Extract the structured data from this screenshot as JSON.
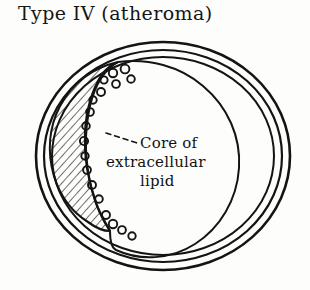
{
  "figure": {
    "title": "Type IV (atheroma)",
    "kind": "hand-drawn medical cross-section diagram"
  },
  "annotation": {
    "line1": "Core of",
    "line2": "extracellular",
    "line3": "lipid",
    "leader": "dashed-leader-line"
  },
  "colors": {
    "ink": "#141414",
    "background": "#fdfdfc",
    "hatch": "#1a1a1a"
  },
  "structure": {
    "wall_rings": [
      {
        "name": "adventitia-outer-ring",
        "rx": 127,
        "ry": 114
      },
      {
        "name": "media-middle-ring",
        "rx": 119,
        "ry": 106
      },
      {
        "name": "intima-inner-ring",
        "rx": 111,
        "ry": 99
      }
    ],
    "lumen": {
      "name": "lumen-boundary",
      "rx": 93,
      "ry": 86
    },
    "lesion": {
      "name": "atheroma-plaque",
      "fill": "diagonal-hatching",
      "position": "left-crescent"
    },
    "foam_cells_upper": [
      {
        "cx": 113,
        "cy": 73,
        "r": 4.2
      },
      {
        "cx": 125,
        "cy": 69,
        "r": 4.4
      },
      {
        "cx": 131,
        "cy": 79,
        "r": 3.8
      },
      {
        "cx": 116,
        "cy": 84,
        "r": 3.9
      },
      {
        "cx": 104,
        "cy": 80,
        "r": 3.6
      },
      {
        "cx": 101,
        "cy": 92,
        "r": 4.0
      },
      {
        "cx": 93,
        "cy": 100,
        "r": 3.7
      },
      {
        "cx": 90,
        "cy": 112,
        "r": 3.9
      },
      {
        "cx": 86,
        "cy": 126,
        "r": 3.8
      },
      {
        "cx": 84,
        "cy": 141,
        "r": 4.1
      },
      {
        "cx": 85,
        "cy": 156,
        "r": 3.7
      },
      {
        "cx": 87,
        "cy": 170,
        "r": 3.9
      },
      {
        "cx": 92,
        "cy": 185,
        "r": 4.0
      },
      {
        "cx": 99,
        "cy": 199,
        "r": 3.8
      }
    ],
    "foam_cells_trail": [
      {
        "cx": 106,
        "cy": 215,
        "r": 4.0
      },
      {
        "cx": 113,
        "cy": 224,
        "r": 4.2
      },
      {
        "cx": 122,
        "cy": 230,
        "r": 3.9
      },
      {
        "cx": 132,
        "cy": 236,
        "r": 3.7
      }
    ]
  }
}
